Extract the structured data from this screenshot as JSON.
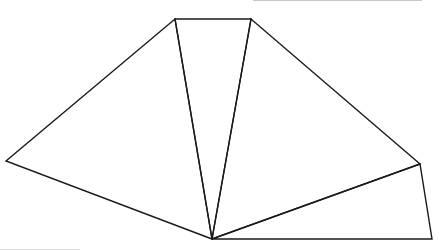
{
  "diagram": {
    "type": "geometry-figure",
    "stroke_color": "#1a1a1a",
    "background": "#ffffff",
    "vertices": {
      "A": [
        6,
        161
      ],
      "B": [
        175,
        19
      ],
      "C": [
        251,
        19
      ],
      "D": [
        420,
        164
      ],
      "E": [
        432,
        239
      ],
      "O": [
        212,
        239
      ]
    },
    "triangles": [
      [
        "O",
        "A",
        "B"
      ],
      [
        "O",
        "B",
        "C"
      ],
      [
        "O",
        "C",
        "D"
      ],
      [
        "O",
        "D",
        "E"
      ]
    ]
  }
}
